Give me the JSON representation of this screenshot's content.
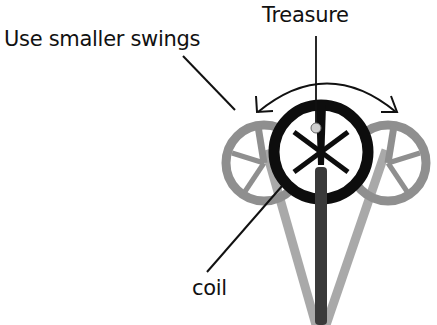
{
  "labels": {
    "treasure": "Treasure",
    "swing_instruction": "Use smaller swings",
    "coil": "coil"
  },
  "colors": {
    "background": "#ffffff",
    "main_coil": "#0d0d0d",
    "ghost_coil": "#8f8f8f",
    "ghost_shaft": "#a9a9a9",
    "center_shaft": "#3a3a3a",
    "treasure_dot": "#cfcfcf",
    "line": "#111111"
  },
  "diagram": {
    "elements": [
      "main-coil",
      "left-ghost-coil",
      "right-ghost-coil",
      "swing-arc-arrow",
      "treasure-target",
      "detector-shaft"
    ]
  }
}
